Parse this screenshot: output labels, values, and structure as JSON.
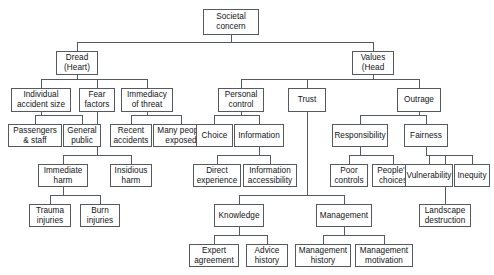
{
  "diagram": {
    "type": "tree-diagram",
    "style": {
      "box_border_color": "#555a5e",
      "box_fill_color": "#ffffff",
      "text_color": "#111315",
      "edge_color": "#555a5e",
      "background": "#ffffff"
    },
    "nodes": [
      {
        "id": "societal-concern",
        "label": "Societal\nconcern",
        "x": 203,
        "y": 9,
        "w": 56,
        "h": 26
      },
      {
        "id": "dread-heart",
        "label": "Dread\n(Heart)",
        "x": 56,
        "y": 51,
        "w": 42,
        "h": 24
      },
      {
        "id": "values-head",
        "label": "Values\n(Head",
        "x": 352,
        "y": 51,
        "w": 42,
        "h": 24
      },
      {
        "id": "individual-accident",
        "label": "Individual\naccident size",
        "x": 11,
        "y": 88,
        "w": 60,
        "h": 24
      },
      {
        "id": "fear-factors",
        "label": "Fear\nfactors",
        "x": 79,
        "y": 88,
        "w": 36,
        "h": 24
      },
      {
        "id": "immediacy-threat",
        "label": "Immediacy\nof threat",
        "x": 121,
        "y": 88,
        "w": 52,
        "h": 24
      },
      {
        "id": "personal-control",
        "label": "Personal\ncontrol",
        "x": 218,
        "y": 88,
        "w": 46,
        "h": 24
      },
      {
        "id": "trust",
        "label": "Trust",
        "x": 288,
        "y": 88,
        "w": 38,
        "h": 24
      },
      {
        "id": "outrage",
        "label": "Outrage",
        "x": 397,
        "y": 88,
        "w": 44,
        "h": 24
      },
      {
        "id": "passengers-staff",
        "label": "Passengers\n& staff",
        "x": 8,
        "y": 124,
        "w": 54,
        "h": 23
      },
      {
        "id": "general-public",
        "label": "General\npublic",
        "x": 63,
        "y": 124,
        "w": 38,
        "h": 23
      },
      {
        "id": "recent-accidents",
        "label": "Recent\naccidents",
        "x": 110,
        "y": 124,
        "w": 42,
        "h": 23
      },
      {
        "id": "many-people-exposed",
        "label": "Many people\nexposed",
        "x": 153,
        "y": 124,
        "w": 56,
        "h": 23
      },
      {
        "id": "choice",
        "label": "Choice",
        "x": 196,
        "y": 124,
        "w": 37,
        "h": 23
      },
      {
        "id": "information",
        "label": "Information",
        "x": 234,
        "y": 124,
        "w": 50,
        "h": 23
      },
      {
        "id": "responsibility",
        "label": "Responsibility",
        "x": 332,
        "y": 124,
        "w": 56,
        "h": 23
      },
      {
        "id": "fairness",
        "label": "Fairness",
        "x": 404,
        "y": 124,
        "w": 44,
        "h": 23
      },
      {
        "id": "immediate-harm",
        "label": "Immediate\nharm",
        "x": 38,
        "y": 164,
        "w": 50,
        "h": 23
      },
      {
        "id": "insidious-harm",
        "label": "Insidious\nharm",
        "x": 110,
        "y": 164,
        "w": 42,
        "h": 23
      },
      {
        "id": "direct-experience",
        "label": "Direct\nexperience",
        "x": 193,
        "y": 164,
        "w": 48,
        "h": 23
      },
      {
        "id": "information-access",
        "label": "Information\naccessibility",
        "x": 243,
        "y": 164,
        "w": 54,
        "h": 23
      },
      {
        "id": "poor-controls",
        "label": "Poor\ncontrols",
        "x": 330,
        "y": 164,
        "w": 38,
        "h": 23
      },
      {
        "id": "peoples-choices",
        "label": "People's\nchoices",
        "x": 372,
        "y": 164,
        "w": 42,
        "h": 23
      },
      {
        "id": "vulnerability",
        "label": "Vulnerability",
        "x": 405,
        "y": 164,
        "w": 48,
        "h": 23
      },
      {
        "id": "inequity",
        "label": "Inequity",
        "x": 454,
        "y": 164,
        "w": 36,
        "h": 23
      },
      {
        "id": "trauma-injuries",
        "label": "Trauma\ninjuries",
        "x": 29,
        "y": 204,
        "w": 42,
        "h": 23
      },
      {
        "id": "burn-injuries",
        "label": "Burn\ninjuries",
        "x": 80,
        "y": 204,
        "w": 40,
        "h": 23
      },
      {
        "id": "knowledge",
        "label": "Knowledge",
        "x": 214,
        "y": 204,
        "w": 50,
        "h": 23
      },
      {
        "id": "management",
        "label": "Management",
        "x": 316,
        "y": 204,
        "w": 56,
        "h": 23
      },
      {
        "id": "landscape-destruction",
        "label": "Landscape\ndestruction",
        "x": 419,
        "y": 204,
        "w": 52,
        "h": 23
      },
      {
        "id": "expert-agreement",
        "label": "Expert\nagreement",
        "x": 189,
        "y": 244,
        "w": 50,
        "h": 23
      },
      {
        "id": "advice-history",
        "label": "Advice\nhistory",
        "x": 246,
        "y": 244,
        "w": 42,
        "h": 23
      },
      {
        "id": "management-history",
        "label": "Management\nhistory",
        "x": 295,
        "y": 244,
        "w": 56,
        "h": 23
      },
      {
        "id": "management-motivation",
        "label": "Management\nmotivation",
        "x": 355,
        "y": 244,
        "w": 58,
        "h": 23
      }
    ],
    "edges": [
      {
        "from": "societal-concern",
        "to": [
          "dread-heart",
          "values-head"
        ]
      },
      {
        "from": "dread-heart",
        "to": [
          "individual-accident",
          "fear-factors",
          "immediacy-threat"
        ]
      },
      {
        "from": "values-head",
        "to": [
          "personal-control",
          "trust",
          "outrage"
        ]
      },
      {
        "from": "individual-accident",
        "to": [
          "passengers-staff",
          "general-public"
        ]
      },
      {
        "from": "immediacy-threat",
        "to": [
          "recent-accidents",
          "many-people-exposed"
        ]
      },
      {
        "from": "personal-control",
        "to": [
          "choice",
          "information"
        ]
      },
      {
        "from": "outrage",
        "to": [
          "responsibility",
          "fairness"
        ]
      },
      {
        "from": "fear-factors",
        "to": [
          "immediate-harm",
          "insidious-harm"
        ]
      },
      {
        "from": "information",
        "to": [
          "direct-experience",
          "information-access"
        ]
      },
      {
        "from": "responsibility",
        "to": [
          "poor-controls",
          "peoples-choices"
        ]
      },
      {
        "from": "fairness",
        "to": [
          "vulnerability",
          "inequity",
          "landscape-destruction"
        ]
      },
      {
        "from": "immediate-harm",
        "to": [
          "trauma-injuries",
          "burn-injuries"
        ]
      },
      {
        "from": "trust",
        "to": [
          "knowledge",
          "management"
        ]
      },
      {
        "from": "knowledge",
        "to": [
          "expert-agreement",
          "advice-history"
        ]
      },
      {
        "from": "management",
        "to": [
          "management-history",
          "management-motivation"
        ]
      }
    ]
  }
}
